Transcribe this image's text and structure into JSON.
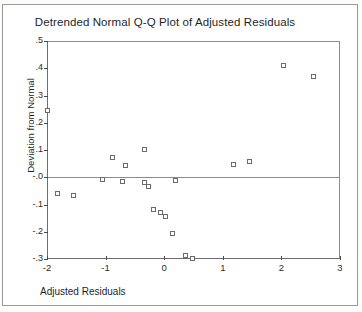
{
  "chart_data": {
    "type": "scatter",
    "title": "Detrended Normal Q-Q Plot of Adjusted Residuals",
    "xlabel": "Adjusted Residuals",
    "ylabel": "Deviation from Normal",
    "xlim": [
      -2,
      3
    ],
    "ylim": [
      -0.3,
      0.5
    ],
    "xticks": [
      -2,
      -1,
      0,
      1,
      2,
      3
    ],
    "xtick_labels": [
      "-2",
      "-1",
      "0",
      "1",
      "2",
      "3"
    ],
    "yticks": [
      0.5,
      0.4,
      0.3,
      0.2,
      0.1,
      0.0,
      -0.1,
      -0.2,
      -0.3
    ],
    "ytick_labels": [
      ".5",
      ".4",
      ".3",
      ".2",
      ".1",
      "-.0",
      "-.1",
      "-.2",
      "-.3"
    ],
    "grid": false,
    "legend": null,
    "reference_line": {
      "y": 0.0,
      "orientation": "horizontal"
    },
    "marker": {
      "shape": "open-square",
      "size": 5,
      "edge_color": "#6b6b6b",
      "face_color": "#ffffff"
    },
    "points": [
      {
        "x": -2.0,
        "y": 0.245
      },
      {
        "x": -1.83,
        "y": -0.059
      },
      {
        "x": -1.55,
        "y": -0.066
      },
      {
        "x": -1.05,
        "y": -0.008
      },
      {
        "x": -0.88,
        "y": 0.071
      },
      {
        "x": -0.72,
        "y": -0.016
      },
      {
        "x": -0.66,
        "y": 0.043
      },
      {
        "x": -0.34,
        "y": 0.102
      },
      {
        "x": -0.33,
        "y": -0.019
      },
      {
        "x": -0.27,
        "y": -0.035
      },
      {
        "x": -0.19,
        "y": -0.118
      },
      {
        "x": -0.06,
        "y": -0.129
      },
      {
        "x": 0.02,
        "y": -0.145
      },
      {
        "x": 0.14,
        "y": -0.205
      },
      {
        "x": 0.2,
        "y": -0.012
      },
      {
        "x": 0.36,
        "y": -0.287
      },
      {
        "x": 0.49,
        "y": -0.299
      },
      {
        "x": 1.18,
        "y": 0.047
      },
      {
        "x": 1.45,
        "y": 0.057
      },
      {
        "x": 2.04,
        "y": 0.41
      },
      {
        "x": 2.55,
        "y": 0.37
      }
    ]
  }
}
